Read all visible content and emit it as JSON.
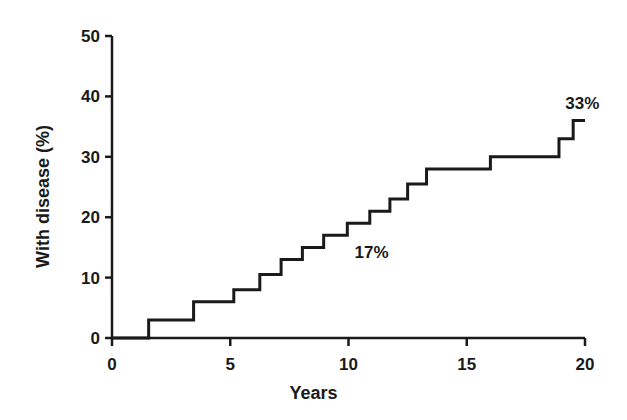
{
  "chart_data": {
    "type": "line",
    "subtype": "step-kaplan-meier-cumulative-incidence",
    "title": "",
    "xlabel": "Years",
    "ylabel": "With disease (%)",
    "xlim": [
      0,
      20
    ],
    "ylim": [
      0,
      50
    ],
    "xticks": [
      0,
      5,
      10,
      15,
      20
    ],
    "xtick_labels": [
      "0",
      "5",
      "10",
      "15",
      "20"
    ],
    "yticks": [
      0,
      10,
      20,
      30,
      40,
      50
    ],
    "ytick_labels": [
      "0",
      "10",
      "20",
      "30",
      "40",
      "50"
    ],
    "grid": false,
    "legend": false,
    "line_color": "#1a1a1a",
    "line_width": 3,
    "series": [
      {
        "name": "Cumulative incidence of disease",
        "x": [
          0.0,
          1.55,
          1.55,
          3.45,
          3.45,
          5.15,
          5.15,
          6.25,
          6.25,
          7.15,
          7.15,
          8.05,
          8.05,
          8.95,
          8.95,
          9.95,
          9.95,
          10.9,
          10.9,
          11.75,
          11.75,
          12.5,
          12.5,
          13.3,
          13.3,
          16.0,
          16.0,
          18.9,
          18.9,
          19.5,
          19.5,
          20.0
        ],
        "y": [
          0.0,
          0.0,
          3.0,
          3.0,
          6.0,
          6.0,
          8.0,
          8.0,
          10.5,
          10.5,
          13.0,
          13.0,
          15.0,
          15.0,
          17.0,
          17.0,
          19.0,
          19.0,
          21.0,
          21.0,
          23.0,
          23.0,
          25.5,
          25.5,
          28.0,
          28.0,
          30.0,
          30.0,
          33.0,
          33.0,
          36.0,
          36.0
        ]
      }
    ],
    "annotations": [
      {
        "text": "17%",
        "x": 10.0,
        "y": 17.0,
        "position": "below-right"
      },
      {
        "text": "33%",
        "x": 19.0,
        "y": 33.0,
        "position": "above-right"
      }
    ]
  },
  "axes": {
    "y_title": "With disease (%)",
    "x_title": "Years"
  }
}
